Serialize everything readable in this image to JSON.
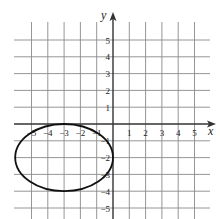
{
  "chart_data": {
    "type": "line",
    "title": "",
    "xlabel": "x",
    "ylabel": "y",
    "xlim": [
      -5,
      5
    ],
    "ylim": [
      -5,
      5
    ],
    "grid": true,
    "x_ticks": [
      -5,
      -4,
      -3,
      -2,
      -1,
      1,
      2,
      3,
      4,
      5
    ],
    "y_ticks": [
      5,
      4,
      3,
      2,
      1,
      -1,
      -2,
      -3,
      -4,
      -5
    ],
    "x_tick_labels": [
      "−5",
      "−4",
      "−3",
      "−2",
      "−1",
      "1",
      "2",
      "3",
      "4",
      "5"
    ],
    "y_tick_labels": [
      "5",
      "4",
      "3",
      "2",
      "1",
      "−1",
      "−2",
      "−3",
      "−4",
      "−5"
    ],
    "series": [
      {
        "name": "ellipse",
        "shape": "ellipse",
        "center": [
          -3,
          -2
        ],
        "semi_axis_x": 3,
        "semi_axis_y": 2,
        "color": "#111111"
      }
    ]
  },
  "colors": {
    "grid": "#8a8a8a",
    "axis": "#333333",
    "curve": "#111111"
  }
}
